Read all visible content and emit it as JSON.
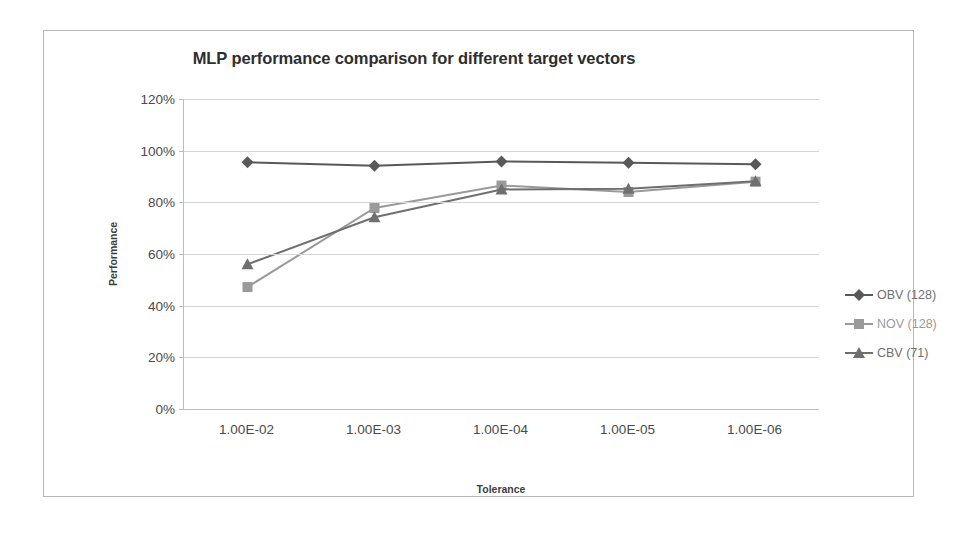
{
  "chart_data": {
    "type": "line",
    "title": "MLP performance comparison for different target vectors",
    "xlabel": "Tolerance",
    "ylabel": "Performance",
    "categories": [
      "1.00E-02",
      "1.00E-03",
      "1.00E-04",
      "1.00E-05",
      "1.00E-06"
    ],
    "ylim": [
      0,
      120
    ],
    "yticks": [
      "0%",
      "20%",
      "40%",
      "60%",
      "80%",
      "100%",
      "120%"
    ],
    "ytick_values": [
      0,
      20,
      40,
      60,
      80,
      100,
      120
    ],
    "grid": "horizontal",
    "legend_position": "right",
    "series": [
      {
        "name": "OBV (128)",
        "marker": "diamond",
        "color": "#595959",
        "values": [
          95.5,
          94.2,
          95.8,
          95.3,
          94.7
        ]
      },
      {
        "name": "NOV (128)",
        "marker": "square",
        "color": "#9a9a9a",
        "values": [
          47.2,
          77.8,
          86.5,
          84.0,
          88.0
        ]
      },
      {
        "name": "CBV (71)",
        "marker": "triangle",
        "color": "#6f6f6f",
        "values": [
          56.0,
          74.2,
          85.0,
          85.3,
          88.2
        ]
      }
    ]
  },
  "colors": {
    "frame_border": "#b6b6b6",
    "gridline": "#d6d6d6",
    "axis": "#bdbdbd",
    "title_text": "#2e2e2e",
    "tick_text": "#4a4a4a",
    "axis_title_text": "#3d3d3d",
    "legend_text": "#6f6f6f"
  }
}
